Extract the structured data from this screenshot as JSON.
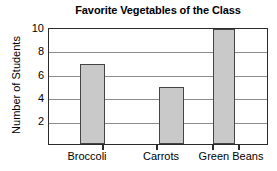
{
  "chart_data": {
    "type": "bar",
    "title": "Favorite Vegetables of the Class",
    "xlabel": "",
    "ylabel": "Number of Students",
    "categories": [
      "Broccoli",
      "Carrots",
      "Green Beans"
    ],
    "values": [
      7,
      5,
      10
    ],
    "ylim": [
      0,
      10
    ],
    "y_ticks": [
      2,
      4,
      6,
      8,
      10
    ],
    "y_tick_labels": [
      "10",
      "8",
      "6",
      "4",
      "2"
    ],
    "grid": "horizontal",
    "legend": "none",
    "colors": {
      "bar_fill": "#c9c9c9",
      "bar_border": "#454545",
      "axis": "#2b2b2b",
      "gridline": "#8a8a8a",
      "background": "#ffffff",
      "text": "#000000"
    }
  }
}
